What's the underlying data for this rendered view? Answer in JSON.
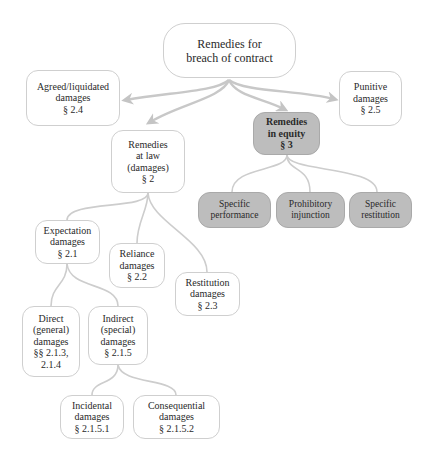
{
  "diagram": {
    "title": "Remedies for breach of contract",
    "colors": {
      "node_border": "#cfcfcf",
      "node_fill": "#ffffff",
      "equity_fill": "#bdbdbd",
      "connector": "#c8c8c8"
    },
    "nodes": {
      "root": {
        "lines": [
          "Remedies for",
          "breach of contract"
        ]
      },
      "agreed": {
        "lines": [
          "Agreed/liquidated",
          "damages",
          "§ 2.4"
        ]
      },
      "punitive": {
        "lines": [
          "Punitive",
          "damages",
          "§ 2.5"
        ]
      },
      "law": {
        "lines": [
          "Remedies",
          "at law",
          "(damages)",
          "§ 2"
        ]
      },
      "equity": {
        "lines": [
          "Remedies",
          "in equity",
          "§ 3"
        ]
      },
      "specific_performance": {
        "lines": [
          "Specific",
          "performance"
        ]
      },
      "prohibitory_injunction": {
        "lines": [
          "Prohibitory",
          "injunction"
        ]
      },
      "specific_restitution": {
        "lines": [
          "Specific",
          "restitution"
        ]
      },
      "expectation": {
        "lines": [
          "Expectation",
          "damages",
          "§ 2.1"
        ]
      },
      "reliance": {
        "lines": [
          "Reliance",
          "damages",
          "§ 2.2"
        ]
      },
      "restitution": {
        "lines": [
          "Restitution",
          "damages",
          "§ 2.3"
        ]
      },
      "direct": {
        "lines": [
          "Direct",
          "(general)",
          "damages",
          "§§ 2.1.3,",
          "2.1.4"
        ]
      },
      "indirect": {
        "lines": [
          "Indirect",
          "(special)",
          "damages",
          "§ 2.1.5"
        ]
      },
      "incidental": {
        "lines": [
          "Incidental",
          "damages",
          "§ 2.1.5.1"
        ]
      },
      "consequential": {
        "lines": [
          "Consequential",
          "damages",
          "§ 2.1.5.2"
        ]
      }
    },
    "edges": [
      {
        "from": "root",
        "to": "agreed",
        "type": "arrow"
      },
      {
        "from": "root",
        "to": "law",
        "type": "arrow"
      },
      {
        "from": "root",
        "to": "equity",
        "type": "arrow"
      },
      {
        "from": "root",
        "to": "punitive",
        "type": "arrow"
      },
      {
        "from": "equity",
        "to": "specific_performance",
        "type": "line"
      },
      {
        "from": "equity",
        "to": "prohibitory_injunction",
        "type": "line"
      },
      {
        "from": "equity",
        "to": "specific_restitution",
        "type": "line"
      },
      {
        "from": "law",
        "to": "expectation",
        "type": "line"
      },
      {
        "from": "law",
        "to": "reliance",
        "type": "line"
      },
      {
        "from": "law",
        "to": "restitution",
        "type": "line"
      },
      {
        "from": "expectation",
        "to": "direct",
        "type": "line"
      },
      {
        "from": "expectation",
        "to": "indirect",
        "type": "line"
      },
      {
        "from": "indirect",
        "to": "incidental",
        "type": "line"
      },
      {
        "from": "indirect",
        "to": "consequential",
        "type": "line"
      }
    ]
  }
}
